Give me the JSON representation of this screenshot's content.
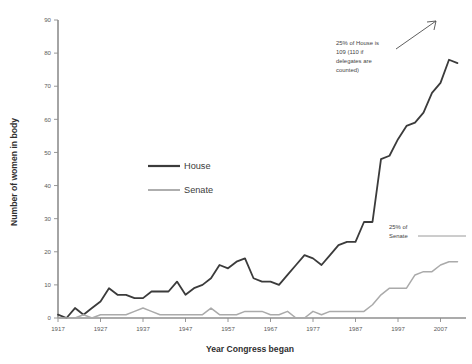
{
  "chart_data": {
    "type": "line",
    "title": "",
    "xlabel": "Year Congress began",
    "ylabel": "Number of women in body",
    "xlim": [
      1917,
      2013
    ],
    "ylim": [
      0,
      90
    ],
    "grid": false,
    "legend_position": "inside-left",
    "x_ticks": [
      1917,
      1927,
      1937,
      1947,
      1957,
      1967,
      1977,
      1987,
      1997,
      2007
    ],
    "y_ticks": [
      0,
      10,
      20,
      30,
      40,
      50,
      60,
      70,
      80,
      90
    ],
    "x": [
      1917,
      1919,
      1921,
      1923,
      1925,
      1927,
      1929,
      1931,
      1933,
      1935,
      1937,
      1939,
      1941,
      1943,
      1945,
      1947,
      1949,
      1951,
      1953,
      1955,
      1957,
      1959,
      1961,
      1963,
      1965,
      1967,
      1969,
      1971,
      1973,
      1975,
      1977,
      1979,
      1981,
      1983,
      1985,
      1987,
      1989,
      1991,
      1993,
      1995,
      1997,
      1999,
      2001,
      2003,
      2005,
      2007,
      2009,
      2011
    ],
    "series": [
      {
        "name": "House",
        "color": "#3b3b3b",
        "values": [
          1,
          0,
          3,
          1,
          3,
          5,
          9,
          7,
          7,
          6,
          6,
          8,
          8,
          8,
          11,
          7,
          9,
          10,
          12,
          16,
          15,
          17,
          18,
          12,
          11,
          11,
          10,
          13,
          16,
          19,
          18,
          16,
          19,
          22,
          23,
          23,
          29,
          29,
          48,
          49,
          54,
          58,
          59,
          62,
          68,
          71,
          78,
          77
        ]
      },
      {
        "name": "Senate",
        "color": "#aaaaaa",
        "values": [
          0,
          0,
          0,
          1,
          0,
          1,
          1,
          1,
          1,
          2,
          3,
          2,
          1,
          1,
          1,
          1,
          1,
          1,
          3,
          1,
          1,
          1,
          2,
          2,
          2,
          1,
          1,
          2,
          0,
          0,
          2,
          1,
          2,
          2,
          2,
          2,
          2,
          4,
          7,
          9,
          9,
          9,
          13,
          14,
          14,
          16,
          17,
          17
        ]
      }
    ],
    "annotations": [
      {
        "id": "house-25-percent",
        "text_lines": [
          "25% of House is",
          "109 (110 if",
          "delegates are",
          "counted)"
        ],
        "has_arrow": true
      },
      {
        "id": "senate-25-percent",
        "text_lines": [
          "25% of",
          "Senate"
        ],
        "has_rule": true,
        "rule_value": 25
      }
    ]
  },
  "legend": {
    "items": [
      {
        "label": "House",
        "color": "#3b3b3b",
        "width": 1.8
      },
      {
        "label": "Senate",
        "color": "#aaaaaa",
        "width": 1.5
      }
    ]
  }
}
